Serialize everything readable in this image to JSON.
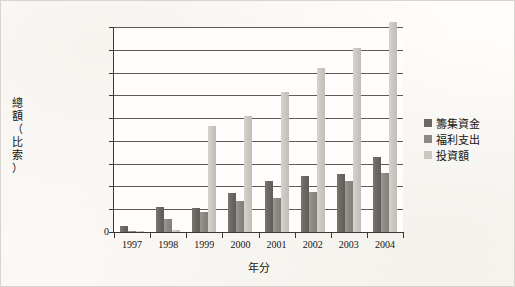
{
  "chart_data": {
    "type": "bar",
    "title": "",
    "xlabel": "年分",
    "ylabel": "總額（比索）",
    "ylabel_chars": [
      "總",
      "額",
      "（",
      "比",
      "索",
      "）"
    ],
    "categories": [
      "1997",
      "1998",
      "1999",
      "2000",
      "2001",
      "2002",
      "2003",
      "2004"
    ],
    "series": [
      {
        "name": "籌集資金",
        "color": "#6a6862",
        "values": [
          1400000000,
          5500000000,
          5300000000,
          8600000000,
          11200000000,
          12200000000,
          12800000000,
          16500000000
        ]
      },
      {
        "name": "福利支出",
        "color": "#8b8983",
        "values": [
          150000000,
          2900000000,
          4400000000,
          6900000000,
          7500000000,
          8800000000,
          11200000000,
          13000000000
        ]
      },
      {
        "name": "投資額",
        "color": "#cac8c1",
        "values": [
          60000000,
          400000000,
          23300000000,
          25500000000,
          30800000000,
          36000000000,
          40400000000,
          46200000000
        ]
      }
    ],
    "ylim": [
      0,
      45000000000
    ],
    "ytick_values": [
      0,
      5000000000,
      10000000000,
      15000000000,
      20000000000,
      25000000000,
      30000000000,
      35000000000,
      40000000000,
      45000000000
    ],
    "ytick_labels": [
      "0",
      "5,000,000,000",
      "10,000,000,000",
      "15,000,000,000",
      "20,000,000,000",
      "25,000,000,000",
      "30,000,000,000",
      "35,000,000,000",
      "40,000,000,000",
      "45,000,000,000"
    ],
    "grid": true,
    "legend_position": "right",
    "legend_entries": [
      "籌集資金",
      "福利支出",
      "投資額"
    ]
  }
}
